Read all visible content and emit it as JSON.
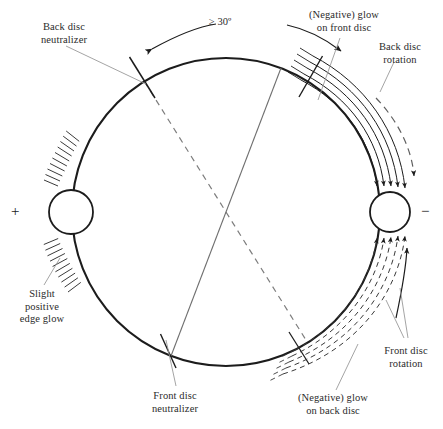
{
  "figure": {
    "type": "technical-diagram",
    "background_color": "#ffffff",
    "line_color": "#1c1c1c",
    "leader_color": "#8a8a8a",
    "text_color": "#2b2b2b"
  },
  "geometry": {
    "main_disc": {
      "cx": 226,
      "cy": 212,
      "r": 154
    },
    "positive_electrode": {
      "cx": 71,
      "cy": 212,
      "r": 22
    },
    "negative_electrode": {
      "cx": 390,
      "cy": 212,
      "r": 20
    }
  },
  "labels": {
    "back_disc_neutralizer": "Back disc\nneutralizer",
    "angle": "≥ 30º",
    "negative_glow_front": "(Negative) glow\non front disc",
    "back_disc_rotation": "Back disc\nrotation",
    "slight_positive_edge_glow": "Slight\npositive\nedge glow",
    "front_disc_neutralizer": "Front disc\nneutralizer",
    "negative_glow_back": "(Negative) glow\non back disc",
    "front_disc_rotation": "Front disc\nrotation",
    "positive_terminal_sign": "+",
    "negative_terminal_sign": "−"
  }
}
